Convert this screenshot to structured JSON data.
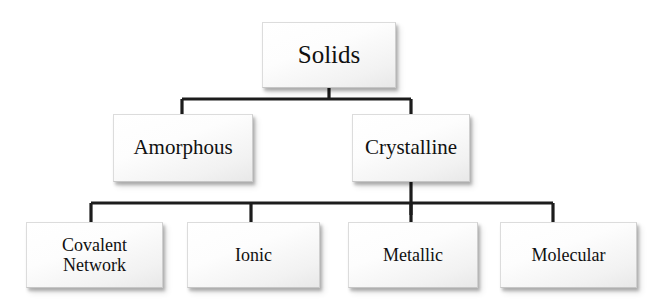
{
  "diagram": {
    "title_node": "Solids",
    "type": "hierarchy-tree",
    "nodes": [
      {
        "id": "solids",
        "label": "Solids",
        "level": 0
      },
      {
        "id": "amorphous",
        "label": "Amorphous",
        "level": 1
      },
      {
        "id": "crystalline",
        "label": "Crystalline",
        "level": 1
      },
      {
        "id": "covalent",
        "label": "Covalent\nNetwork",
        "level": 2
      },
      {
        "id": "ionic",
        "label": "Ionic",
        "level": 2
      },
      {
        "id": "metallic",
        "label": "Metallic",
        "level": 2
      },
      {
        "id": "molecular",
        "label": "Molecular",
        "level": 2
      }
    ],
    "edges": [
      {
        "from": "solids",
        "to": "amorphous"
      },
      {
        "from": "solids",
        "to": "crystalline"
      },
      {
        "from": "crystalline",
        "to": "covalent"
      },
      {
        "from": "crystalline",
        "to": "ionic"
      },
      {
        "from": "crystalline",
        "to": "metallic"
      },
      {
        "from": "crystalline",
        "to": "molecular"
      }
    ],
    "colors": {
      "line": "#1c1c1c",
      "box_fill": "#f7f7f7",
      "box_border": "#dcdcdc",
      "text": "#111111",
      "background": "#ffffff"
    }
  }
}
